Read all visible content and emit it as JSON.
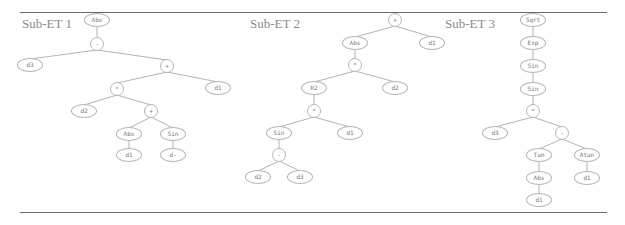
{
  "figure": {
    "panels": [
      {
        "title": "Sub-ET 1",
        "nodes": [
          {
            "id": "a0",
            "label": "Abs",
            "x": 97,
            "y": 20
          },
          {
            "id": "a1",
            "label": "-",
            "x": 97,
            "y": 44
          },
          {
            "id": "a2",
            "label": "d3",
            "x": 30,
            "y": 65
          },
          {
            "id": "a3",
            "label": "+",
            "x": 167,
            "y": 66
          },
          {
            "id": "a4",
            "label": "*",
            "x": 117,
            "y": 89
          },
          {
            "id": "a5",
            "label": "d1",
            "x": 218,
            "y": 88
          },
          {
            "id": "a6",
            "label": "d2",
            "x": 84,
            "y": 111
          },
          {
            "id": "a7",
            "label": "+",
            "x": 151,
            "y": 111
          },
          {
            "id": "a8",
            "label": "Abs",
            "x": 129,
            "y": 134
          },
          {
            "id": "a9",
            "label": "Sin",
            "x": 173,
            "y": 134
          },
          {
            "id": "a10",
            "label": "d1",
            "x": 129,
            "y": 155
          },
          {
            "id": "a11",
            "label": "d-",
            "x": 173,
            "y": 155
          }
        ],
        "edges": [
          [
            "a0",
            "a1"
          ],
          [
            "a1",
            "a2"
          ],
          [
            "a1",
            "a3"
          ],
          [
            "a3",
            "a4"
          ],
          [
            "a3",
            "a5"
          ],
          [
            "a4",
            "a6"
          ],
          [
            "a4",
            "a7"
          ],
          [
            "a7",
            "a8"
          ],
          [
            "a7",
            "a9"
          ],
          [
            "a8",
            "a10"
          ],
          [
            "a9",
            "a11"
          ]
        ]
      },
      {
        "title": "Sub-ET 2",
        "nodes": [
          {
            "id": "b0",
            "label": "+",
            "x": 395,
            "y": 20
          },
          {
            "id": "b1",
            "label": "Abs",
            "x": 355,
            "y": 43
          },
          {
            "id": "b2",
            "label": "d1",
            "x": 432,
            "y": 43
          },
          {
            "id": "b3",
            "label": "*",
            "x": 355,
            "y": 65
          },
          {
            "id": "b4",
            "label": "R2",
            "x": 314,
            "y": 88
          },
          {
            "id": "b5",
            "label": "d2",
            "x": 395,
            "y": 88
          },
          {
            "id": "b6",
            "label": "*",
            "x": 314,
            "y": 111
          },
          {
            "id": "b7",
            "label": "Sin",
            "x": 279,
            "y": 133
          },
          {
            "id": "b8",
            "label": "d1",
            "x": 350,
            "y": 133
          },
          {
            "id": "b9",
            "label": "-",
            "x": 279,
            "y": 155
          },
          {
            "id": "b10",
            "label": "d2",
            "x": 258,
            "y": 177
          },
          {
            "id": "b11",
            "label": "d3",
            "x": 300,
            "y": 177
          }
        ],
        "edges": [
          [
            "b0",
            "b1"
          ],
          [
            "b0",
            "b2"
          ],
          [
            "b1",
            "b3"
          ],
          [
            "b3",
            "b4"
          ],
          [
            "b3",
            "b5"
          ],
          [
            "b4",
            "b6"
          ],
          [
            "b6",
            "b7"
          ],
          [
            "b6",
            "b8"
          ],
          [
            "b7",
            "b9"
          ],
          [
            "b9",
            "b10"
          ],
          [
            "b9",
            "b11"
          ]
        ]
      },
      {
        "title": "Sub-ET 3",
        "nodes": [
          {
            "id": "c0",
            "label": "Sqrt",
            "x": 533,
            "y": 20
          },
          {
            "id": "c1",
            "label": "Exp",
            "x": 533,
            "y": 43
          },
          {
            "id": "c2",
            "label": "Sin",
            "x": 533,
            "y": 66
          },
          {
            "id": "c3",
            "label": "Sin",
            "x": 533,
            "y": 89
          },
          {
            "id": "c4",
            "label": "*",
            "x": 533,
            "y": 111
          },
          {
            "id": "c5",
            "label": "d3",
            "x": 495,
            "y": 133
          },
          {
            "id": "c6",
            "label": "-",
            "x": 562,
            "y": 133
          },
          {
            "id": "c7",
            "label": "Tan",
            "x": 539,
            "y": 155
          },
          {
            "id": "c8",
            "label": "Atan",
            "x": 587,
            "y": 155
          },
          {
            "id": "c9",
            "label": "Abs",
            "x": 539,
            "y": 178
          },
          {
            "id": "c10",
            "label": "d1",
            "x": 587,
            "y": 178
          },
          {
            "id": "c11",
            "label": "d1",
            "x": 539,
            "y": 200
          }
        ],
        "edges": [
          [
            "c0",
            "c1"
          ],
          [
            "c1",
            "c2"
          ],
          [
            "c2",
            "c3"
          ],
          [
            "c3",
            "c4"
          ],
          [
            "c4",
            "c5"
          ],
          [
            "c4",
            "c6"
          ],
          [
            "c6",
            "c7"
          ],
          [
            "c6",
            "c8"
          ],
          [
            "c7",
            "c9"
          ],
          [
            "c8",
            "c10"
          ],
          [
            "c9",
            "c11"
          ]
        ]
      }
    ],
    "colors": {
      "edge": "#a0a0a0",
      "node_border": "#b5b5b5",
      "title": "#8a8a8a",
      "rule": "#6a6a6a"
    }
  }
}
